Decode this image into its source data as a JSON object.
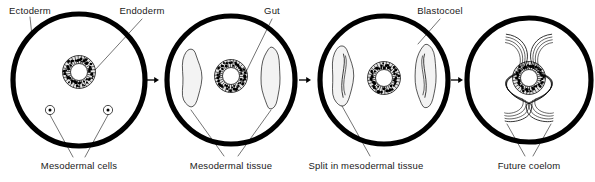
{
  "figure": {
    "background_color": "#ffffff",
    "ink_color": "#000000",
    "label_color": "#1a1a1a"
  },
  "labels": {
    "ectoderm": "Ectoderm",
    "endoderm": "Endoderm",
    "gut": "Gut",
    "blastocoel": "Blastocoel",
    "mesodermal_cells": "Mesodermal cells",
    "mesodermal_tissue": "Mesodermal tissue",
    "split_in_mesodermal_tissue": "Split in mesodermal tissue",
    "future_coelom": "Future coelom"
  },
  "panels": [
    {
      "index": 1,
      "name": "panel-mesodermal-cells",
      "center_x": 79,
      "center_y": 80,
      "radius": 66,
      "labels_above": [
        "Ectoderm",
        "Endoderm"
      ],
      "labels_below": [
        "Mesodermal cells"
      ],
      "features": [
        "ectoderm-wall",
        "gut-ring",
        "mesodermal-cell",
        "mesodermal-cell"
      ]
    },
    {
      "index": 2,
      "name": "panel-mesodermal-tissue",
      "center_x": 231,
      "center_y": 80,
      "radius": 64,
      "labels_above": [
        "Gut"
      ],
      "labels_below": [
        "Mesodermal tissue"
      ],
      "features": [
        "ectoderm-wall",
        "gut-ring",
        "mesoderm-blob-left",
        "mesoderm-blob-right"
      ]
    },
    {
      "index": 3,
      "name": "panel-split-in-mesoderm",
      "center_x": 384,
      "center_y": 80,
      "radius": 64,
      "labels_above": [
        "Blastocoel"
      ],
      "labels_below": [
        "Split in mesodermal tissue"
      ],
      "features": [
        "ectoderm-wall",
        "gut-ring",
        "split-blob-left",
        "split-blob-right"
      ]
    },
    {
      "index": 4,
      "name": "panel-future-coelom",
      "center_x": 529,
      "center_y": 80,
      "radius": 62,
      "labels_above": [],
      "labels_below": [
        "Future coelom"
      ],
      "features": [
        "ectoderm-wall",
        "gut-ring",
        "coelom-fold-left",
        "coelom-fold-right"
      ]
    }
  ],
  "arrows": [
    {
      "name": "arrow-1-to-2",
      "x": 152,
      "y": 80
    },
    {
      "name": "arrow-2-to-3",
      "x": 304,
      "y": 80
    },
    {
      "name": "arrow-3-to-4",
      "x": 456,
      "y": 80
    }
  ]
}
